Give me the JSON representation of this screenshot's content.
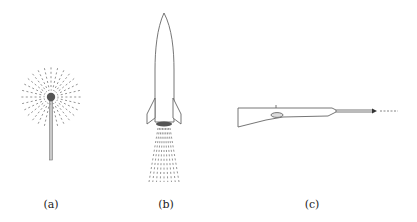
{
  "figure": {
    "panels": [
      {
        "id": "a",
        "label": "(a)",
        "subject": "sparkler",
        "label_x": 51,
        "label_y": 200
      },
      {
        "id": "b",
        "label": "(b)",
        "subject": "rocket",
        "label_x": 168,
        "label_y": 200
      },
      {
        "id": "c",
        "label": "(c)",
        "subject": "rifle",
        "label_x": 310,
        "label_y": 200
      }
    ],
    "colors": {
      "stroke": "#555555",
      "dash": "#888888",
      "fill_dark": "#444444"
    }
  }
}
